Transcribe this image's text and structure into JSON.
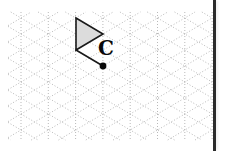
{
  "canvas": {
    "width": 228,
    "height": 151,
    "background_color": "#ffffff"
  },
  "grid": {
    "kind": "triangular-isometric-dotted",
    "dot_color": "#b9b9b9",
    "dot_size": 1,
    "dash_pattern": "1 2",
    "origin_x": 21,
    "origin_y": 18,
    "column_spacing": 27.3,
    "row_spacing": 32,
    "columns": 8,
    "rows": 5,
    "vertical_lines": [
      21,
      48.3,
      75.6,
      102.9,
      130.2,
      157.5,
      184.8,
      212.1
    ],
    "horizontal_rows": [
      18,
      34,
      50,
      66,
      82,
      98,
      114,
      130
    ],
    "visible_extent": {
      "left": 8,
      "top": 12,
      "right": 212,
      "bottom": 140
    }
  },
  "figure": {
    "name": "shaded-triangle",
    "fill_color": "#dcdcdc",
    "stroke_color": "#1a1a1a",
    "stroke_width": 1.6,
    "vertices": [
      {
        "label": "top",
        "x": 76,
        "y": 18
      },
      {
        "label": "apex-right",
        "x": 103,
        "y": 34
      },
      {
        "label": "bottom",
        "x": 76,
        "y": 50
      }
    ]
  },
  "connector": {
    "name": "center-of-rotation-connector",
    "stroke_color": "#1a1a1a",
    "stroke_width": 1.6,
    "from": {
      "x": 76,
      "y": 50
    },
    "to": {
      "x": 103,
      "y": 66
    }
  },
  "marker": {
    "name": "center-of-rotation-point",
    "x": 103,
    "y": 66,
    "radius": 3.4,
    "color": "#0a0a0a"
  },
  "labels": {
    "triangle_label": {
      "text": "C",
      "x": 98,
      "y": 38,
      "font_size": 20,
      "color": "#0a0a0a"
    }
  },
  "border": {
    "name": "panel-right-border",
    "color": "#2b2b2b",
    "x": 213,
    "width": 3,
    "shadow_color": "#cfcfcf"
  }
}
